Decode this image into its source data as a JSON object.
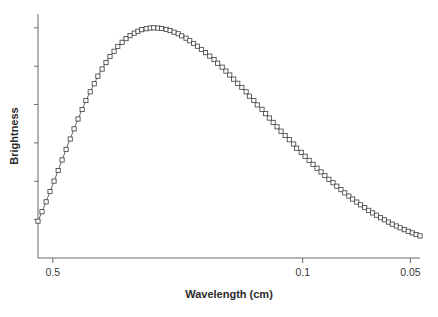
{
  "figure": {
    "background": "#ffffff",
    "line_color": "#555555",
    "marker_edge_color": "#3c3c3c",
    "marker_face_color": "#ffffff",
    "axis_color": "#6b6b6b",
    "text_color": "#2b2b2b"
  },
  "chart_data": {
    "type": "line",
    "title": "",
    "xlabel": "Wavelength (cm)",
    "ylabel": "Brightness",
    "xscale": "log",
    "x_inverted": true,
    "grid": false,
    "legend": "none",
    "marker": "open-square",
    "xlim": [
      0.55,
      0.047
    ],
    "ylim": [
      0,
      1.06
    ],
    "xticks": [
      0.5,
      0.1,
      0.05
    ],
    "xtick_labels": [
      "0.5",
      "0.1",
      "0.05"
    ],
    "yticks": [
      0.0,
      0.1667,
      0.3333,
      0.5,
      0.6667,
      0.8333,
      1.0
    ],
    "ytick_labels": [
      "",
      "",
      "",
      "",
      "",
      "",
      ""
    ],
    "x": [
      0.55,
      0.536,
      0.522,
      0.509,
      0.496,
      0.483,
      0.471,
      0.459,
      0.447,
      0.436,
      0.425,
      0.414,
      0.404,
      0.393,
      0.383,
      0.374,
      0.364,
      0.355,
      0.346,
      0.337,
      0.329,
      0.32,
      0.312,
      0.304,
      0.296,
      0.289,
      0.282,
      0.274,
      0.267,
      0.261,
      0.254,
      0.248,
      0.241,
      0.235,
      0.229,
      0.223,
      0.218,
      0.212,
      0.207,
      0.202,
      0.197,
      0.192,
      0.187,
      0.182,
      0.177,
      0.173,
      0.168,
      0.164,
      0.16,
      0.156,
      0.152,
      0.148,
      0.144,
      0.141,
      0.137,
      0.134,
      0.13,
      0.127,
      0.124,
      0.121,
      0.118,
      0.115,
      0.112,
      0.109,
      0.106,
      0.104,
      0.101,
      0.0985,
      0.096,
      0.0936,
      0.0912,
      0.0889,
      0.0867,
      0.0845,
      0.0823,
      0.0803,
      0.0782,
      0.0763,
      0.0743,
      0.0725,
      0.0706,
      0.0689,
      0.0671,
      0.0654,
      0.0638,
      0.0622,
      0.0606,
      0.0591,
      0.0576,
      0.0562,
      0.0547,
      0.0534,
      0.052,
      0.0507,
      0.0494,
      0.0482,
      0.047
    ],
    "y": [
      0.16,
      0.201,
      0.244,
      0.289,
      0.334,
      0.38,
      0.426,
      0.472,
      0.517,
      0.561,
      0.604,
      0.645,
      0.684,
      0.722,
      0.757,
      0.79,
      0.821,
      0.849,
      0.875,
      0.898,
      0.919,
      0.937,
      0.953,
      0.966,
      0.977,
      0.985,
      0.992,
      0.996,
      0.999,
      1.0,
      0.999,
      0.997,
      0.993,
      0.988,
      0.981,
      0.974,
      0.965,
      0.955,
      0.944,
      0.932,
      0.92,
      0.906,
      0.892,
      0.877,
      0.862,
      0.846,
      0.829,
      0.812,
      0.795,
      0.777,
      0.759,
      0.741,
      0.722,
      0.703,
      0.684,
      0.665,
      0.646,
      0.627,
      0.608,
      0.589,
      0.57,
      0.551,
      0.532,
      0.514,
      0.495,
      0.477,
      0.459,
      0.442,
      0.424,
      0.407,
      0.39,
      0.374,
      0.358,
      0.342,
      0.327,
      0.312,
      0.297,
      0.283,
      0.269,
      0.256,
      0.243,
      0.231,
      0.219,
      0.207,
      0.196,
      0.186,
      0.175,
      0.166,
      0.156,
      0.147,
      0.139,
      0.131,
      0.123,
      0.116,
      0.109,
      0.102,
      0.096
    ]
  }
}
